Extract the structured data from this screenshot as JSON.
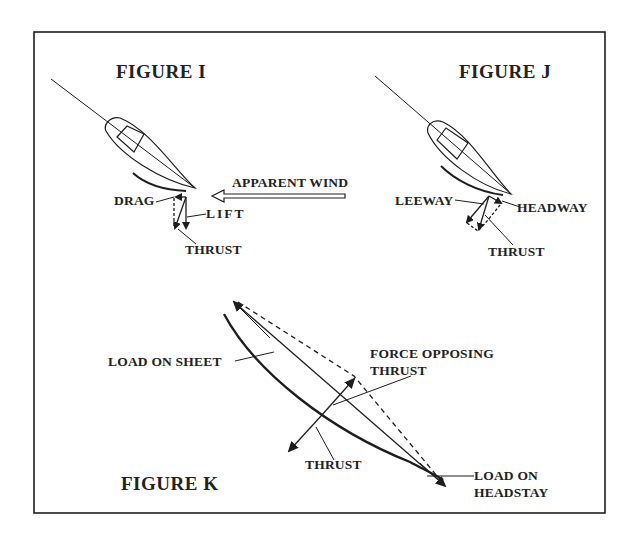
{
  "figure_i": {
    "title": "FIGURE I",
    "labels": {
      "drag": "DRAG",
      "lift": "LIFT",
      "thrust": "THRUST"
    }
  },
  "apparent_wind": {
    "label": "APPARENT WIND"
  },
  "figure_j": {
    "title": "FIGURE J",
    "labels": {
      "leeway": "LEEWAY",
      "headway": "HEADWAY",
      "thrust": "THRUST"
    }
  },
  "figure_k": {
    "title": "FIGURE K",
    "labels": {
      "load_on_sheet": "LOAD ON SHEET",
      "force_opposing_thrust_line1": "FORCE OPPOSING",
      "force_opposing_thrust_line2": "THRUST",
      "thrust": "THRUST",
      "load_on_headstay_line1": "LOAD ON",
      "load_on_headstay_line2": "HEADSTAY"
    }
  },
  "colors": {
    "ink": "#1e1e1e",
    "background": "#ffffff"
  }
}
